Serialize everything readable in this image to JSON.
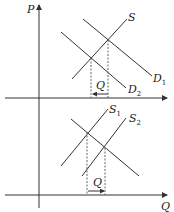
{
  "diagram": {
    "axes": {
      "y_label": "P",
      "x_label": "Q"
    },
    "top_panel": {
      "curves": [
        {
          "name": "S",
          "label": "S",
          "sub": ""
        },
        {
          "name": "D1",
          "label": "D",
          "sub": "1"
        },
        {
          "name": "D2",
          "label": "D",
          "sub": "2"
        }
      ],
      "shift_label": "Q",
      "shift_direction": "left"
    },
    "bottom_panel": {
      "curves": [
        {
          "name": "S1",
          "label": "S",
          "sub": "1"
        },
        {
          "name": "S2",
          "label": "S",
          "sub": "2"
        },
        {
          "name": "D",
          "label": "",
          "sub": ""
        }
      ],
      "shift_label": "Q",
      "shift_direction": "right"
    },
    "colors": {
      "line": "#333333",
      "background": "#ffffff"
    }
  }
}
